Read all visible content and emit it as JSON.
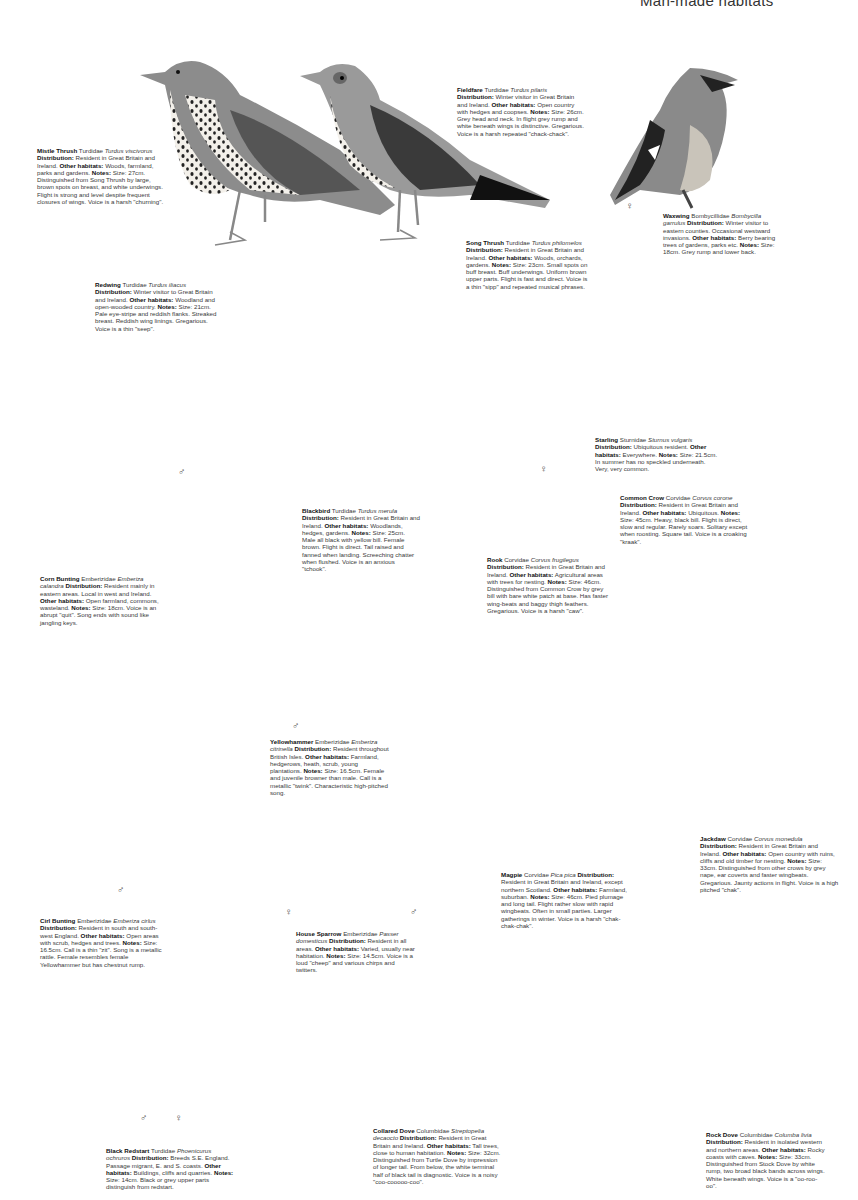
{
  "page": {
    "header": "Man-made habitats",
    "labels": {
      "distribution": "Distribution:",
      "habitats": "Other habitats:",
      "notes": "Notes:"
    },
    "male_symbol": "♂",
    "female_symbol": "♀"
  },
  "species": [
    {
      "name": "Mistle Thrush",
      "family": "Turdidae",
      "latin": "Turdus viscivorus",
      "distribution": "Resident in Great Britain and Ireland.",
      "habitats": "Woods, farmland, parks and gardens.",
      "notes": "Size: 27cm. Distinguished from Song Thrush by large, brown spots on breast, and white underwings. Flight is strong and level despite frequent closures of wings. Voice is a harsh \"churning\"."
    },
    {
      "name": "Fieldfare",
      "family": "Turdidae",
      "latin": "Turdus pilaris",
      "distribution": "Winter visitor in Great Britain and Ireland.",
      "habitats": "Open country with hedges and coopses.",
      "notes": "Size: 26cm. Grey head and neck. In flight grey rump and white beneath wings is distinctive. Gregarious. Voice is a harsh repeated \"chack-chack\"."
    },
    {
      "name": "Waxwing",
      "family": "Bombycillidae",
      "latin": "Bombycilla garrulus",
      "distribution": "Winter visitor to eastern counties. Occasional westward invasions.",
      "habitats": "Berry bearing trees of gardens, parks etc.",
      "notes": "Size: 18cm. Grey rump and lower back."
    },
    {
      "name": "Song Thrush",
      "family": "Turdidae",
      "latin": "Turdus philomelos",
      "distribution": "Resident in Great Britain and Ireland.",
      "habitats": "Woods, orchards, gardens.",
      "notes": "Size: 23cm. Small spots on buff breast. Buff underwings. Uniform brown upper parts. Flight is fast and direct. Voice is a thin \"sipp\" and repeated musical phrases."
    },
    {
      "name": "Redwing",
      "family": "Turdidae",
      "latin": "Turdus iliacus",
      "distribution": "Winter visitor to Great Britain and Ireland.",
      "habitats": "Woodland and open-wooded country.",
      "notes": "Size: 21cm. Pale eye-stripe and reddish flanks. Streaked breast. Reddish wing linings. Gregarious. Voice is a thin \"seep\"."
    },
    {
      "name": "Starling",
      "family": "Sturnidae",
      "latin": "Sturnus vulgaris",
      "distribution": "Ubiquitous resident.",
      "habitats": "Everywhere.",
      "notes": "Size: 21.5cm. In summer has no speckled underneath. Very, very common."
    },
    {
      "name": "Blackbird",
      "family": "Turdidae",
      "latin": "Turdus merula",
      "distribution": "Resident in Great Britain and Ireland.",
      "habitats": "Woodlands, hedges, gardens.",
      "notes": "Size: 25cm. Male all black with yellow bill. Female brown. Flight is direct. Tail raised and fanned when landing. Screeching chatter when flushed. Voice is an anxious \"tchook\"."
    },
    {
      "name": "Common Crow",
      "family": "Corvidae",
      "latin": "Corvus corone",
      "distribution": "Resident in Great Britain and Ireland.",
      "habitats": "Ubiquitous.",
      "notes": "Size: 45cm. Heavy, black bill. Flight is direct, slow and regular. Rarely soars. Solitary except when roosting. Square tail. Voice is a croaking \"kraak\"."
    },
    {
      "name": "Rook",
      "family": "Corvidae",
      "latin": "Corvus frugilegus",
      "distribution": "Resident in Great Britain and Ireland.",
      "habitats": "Agricultural areas with trees for nesting.",
      "notes": "Size: 46cm. Distinguished from Common Crow by grey bill with bare white patch at base. Has faster wing-beats and baggy thigh feathers. Gregarious. Voice is a harsh \"caw\"."
    },
    {
      "name": "Corn Bunting",
      "family": "Emberizidae",
      "latin": "Emberiza calandra",
      "distribution": "Resident mainly in eastern areas. Local in west and Ireland.",
      "habitats": "Open farmland, commons, wasteland.",
      "notes": "Size: 18cm. Voice is an abrupt \"quit\". Song ends with sound like jangling keys."
    },
    {
      "name": "Yellowhammer",
      "family": "Emberizidae",
      "latin": "Emberiza citrinella",
      "distribution": "Resident throughout British Isles.",
      "habitats": "Farmland, hedgerows, heath, scrub, young plantations.",
      "notes": "Size: 16.5cm. Female and juvenile browner than male. Call is a metallic \"twink\". Characteristic high-pitched song."
    },
    {
      "name": "Jackdaw",
      "family": "Corvidae",
      "latin": "Corvus monedula",
      "distribution": "Resident in Great Britain and Ireland.",
      "habitats": "Open country with ruins, cliffs and old timber for nesting.",
      "notes": "Size: 33cm. Distinguished from other crows by grey nape, ear coverts and faster wingbeats. Gregarious. Jaunty actions in flight. Voice is a high pitched \"chak\"."
    },
    {
      "name": "Magpie",
      "family": "Corvidae",
      "latin": "Pica pica",
      "distribution": "Resident in Great Britain and Ireland, except northern Scotland.",
      "habitats": "Farmland, suburban.",
      "notes": "Size: 46cm. Pied plumage and long tail. Flight rather slow with rapid wingbeats. Often in small parties. Larger gatherings in winter. Voice is a harsh \"chak-chak-chak\"."
    },
    {
      "name": "Cirl Bunting",
      "family": "Emberizidae",
      "latin": "Emberiza cirlus",
      "distribution": "Resident in south and south-west England.",
      "habitats": "Open areas with scrub, hedges and trees.",
      "notes": "Size: 16.5cm. Call is a thin \"zit\". Song is a metallic rattle. Female resembles female Yellowhammer but has chestnut rump."
    },
    {
      "name": "House Sparrow",
      "family": "Emberizidae",
      "latin": "Passer domesticus",
      "distribution": "Resident in all areas.",
      "habitats": "Varied, usually near habitation.",
      "notes": "Size: 14.5cm. Voice is a loud \"cheep\" and various chirps and twitters."
    },
    {
      "name": "Black Redstart",
      "family": "Turdidae",
      "latin": "Phoenicurus ochruros",
      "distribution": "Breeds S.E. England. Passage migrant, E. and S. coasts.",
      "habitats": "Buildings, cliffs and quarries.",
      "notes": "Size: 14cm. Black or grey upper parts distinguish from redstart."
    },
    {
      "name": "Collared Dove",
      "family": "Columbidae",
      "latin": "Streptopelia decaocto",
      "distribution": "Resident in Great Britain and Ireland.",
      "habitats": "Tall trees, close to human habitation.",
      "notes": "Size: 32cm. Distinguished from Turtle Dove by impression of longer tail. From below, the white terminal half of black tail is diagnostic. Voice is a noisy \"coo-cooooo-coo\"."
    },
    {
      "name": "Rock Dove",
      "family": "Columbidae",
      "latin": "Columba livia",
      "distribution": "Resident in isolated western and northern areas.",
      "habitats": "Rocky coasts with caves.",
      "notes": "Size: 33cm. Distinguished from Stock Dove by white rump, two broad black bands across wings. White beneath wings. Voice is a \"oo-roo-oo\"."
    }
  ]
}
